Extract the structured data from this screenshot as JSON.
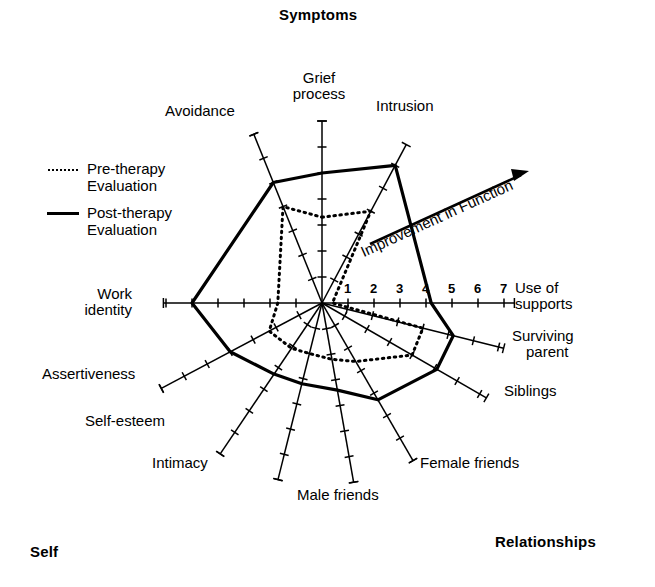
{
  "quadrants": {
    "top": "Symptoms",
    "bottom_right": "Relationships",
    "bottom_left": "Self"
  },
  "legend": {
    "pre": {
      "label_line1": "Pre-therapy",
      "label_line2": "Evaluation",
      "style": "dotted"
    },
    "post": {
      "label_line1": "Post-therapy",
      "label_line2": "Evaluation",
      "style": "solid"
    }
  },
  "annotation": {
    "arrow_label": "Improvement in Function"
  },
  "scale": {
    "ticks": [
      "1",
      "2",
      "3",
      "4",
      "5",
      "6",
      "7"
    ],
    "min": 0,
    "max": 7,
    "unit_px": 26
  },
  "axis_labels": [
    "Grief process",
    "Intrusion",
    "Use of supports",
    "Surviving parent",
    "Siblings",
    "Female friends",
    "Male friends",
    "Intimacy",
    "Self-esteem",
    "Assertiveness",
    "Work identity",
    "Avoidance"
  ],
  "chart_data": {
    "type": "radar",
    "title": "",
    "scale_label": "Improvement in Function",
    "rmin": 0,
    "rmax": 7,
    "rticks": [
      1,
      2,
      3,
      4,
      5,
      6,
      7
    ],
    "grid": false,
    "legend_position": "left",
    "categories": [
      "Grief process",
      "Intrusion",
      "Use of supports",
      "Surviving parent",
      "Siblings",
      "Female friends",
      "Male friends",
      "Intimacy",
      "Self-esteem",
      "Assertiveness",
      "Work identity",
      "Avoidance"
    ],
    "angles_deg": [
      90,
      62,
      0,
      -14,
      -30,
      -60,
      -80,
      -104,
      -124,
      -152,
      180,
      112
    ],
    "series": [
      {
        "name": "Pre-therapy Evaluation",
        "style": "dotted",
        "values": [
          3.3,
          4.0,
          0.4,
          4.0,
          4.0,
          2.6,
          2.2,
          2.0,
          2.1,
          2.3,
          1.7,
          4.0
        ]
      },
      {
        "name": "Post-therapy Evaluation",
        "style": "solid",
        "values": [
          5.0,
          6.0,
          4.2,
          5.2,
          5.1,
          4.3,
          3.4,
          3.2,
          3.3,
          4.0,
          5.0,
          5.0
        ]
      }
    ]
  }
}
